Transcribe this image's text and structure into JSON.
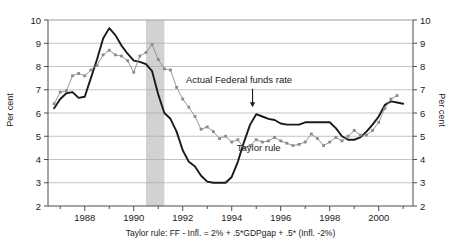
{
  "axes": {
    "ylabel_left": "Per cent",
    "ylabel_right": "Per cent",
    "yticks": [
      "2",
      "3",
      "4",
      "5",
      "6",
      "7",
      "8",
      "9",
      "10"
    ],
    "xticks": [
      "1988",
      "1990",
      "1992",
      "1994",
      "1996",
      "1998",
      "2000"
    ]
  },
  "annotations": {
    "actual_label": "Actual Federal funds rate",
    "taylor_label": "Taylor rule"
  },
  "footnote": "Taylor rule:  FF - Infl. = 2% +  .5*GDPgap +  .5* (Infl. -2%)",
  "colors": {
    "actual_line": "#1a1a1a",
    "taylor_line": "#8a8a8a",
    "recession_band": "#d2d2d2",
    "gridline": "#aaaaaa",
    "axis": "#4d4d4d"
  },
  "chart_data": {
    "type": "line",
    "title": "",
    "xlabel": "",
    "ylabel": "Per cent",
    "xlim": [
      1986.5,
      2001.4
    ],
    "ylim": [
      2,
      10
    ],
    "grid": true,
    "legend": "inline-annotations",
    "xticks": [
      1988,
      1990,
      1992,
      1994,
      1996,
      1998,
      2000
    ],
    "yticks": [
      2,
      3,
      4,
      5,
      6,
      7,
      8,
      9,
      10
    ],
    "recession_band": {
      "start": 1990.5,
      "end": 1991.25,
      "color": "#d2d2d2"
    },
    "annotations": [
      {
        "text": "Actual Federal funds rate",
        "x": 1994.3,
        "y": 7.3,
        "arrow_to_x": 1994.85,
        "arrow_to_y": 6.25
      },
      {
        "text": "Taylor rule",
        "x": 1995.1,
        "y": 4.35
      }
    ],
    "series": [
      {
        "name": "Actual Federal funds rate",
        "color": "#1a1a1a",
        "marker": "none",
        "x": [
          1986.75,
          1987.0,
          1987.25,
          1987.5,
          1987.75,
          1988.0,
          1988.25,
          1988.5,
          1988.75,
          1989.0,
          1989.25,
          1989.5,
          1989.75,
          1990.0,
          1990.25,
          1990.5,
          1990.75,
          1991.0,
          1991.25,
          1991.5,
          1991.75,
          1992.0,
          1992.25,
          1992.5,
          1992.75,
          1993.0,
          1993.25,
          1993.5,
          1993.75,
          1994.0,
          1994.25,
          1994.5,
          1994.75,
          1995.0,
          1995.25,
          1995.5,
          1995.75,
          1996.0,
          1996.25,
          1996.5,
          1996.75,
          1997.0,
          1997.25,
          1997.5,
          1997.75,
          1998.0,
          1998.25,
          1998.5,
          1998.75,
          1999.0,
          1999.25,
          1999.5,
          1999.75,
          2000.0,
          2000.25,
          2000.5,
          2000.75,
          2001.0
        ],
        "y": [
          6.2,
          6.6,
          6.85,
          6.9,
          6.65,
          6.7,
          7.5,
          8.3,
          9.2,
          9.65,
          9.35,
          8.9,
          8.55,
          8.25,
          8.2,
          8.1,
          7.8,
          6.8,
          6.0,
          5.75,
          5.2,
          4.4,
          3.9,
          3.7,
          3.3,
          3.05,
          3.0,
          3.0,
          3.0,
          3.25,
          3.9,
          4.75,
          5.5,
          5.95,
          5.85,
          5.75,
          5.7,
          5.55,
          5.5,
          5.5,
          5.5,
          5.6,
          5.6,
          5.6,
          5.6,
          5.6,
          5.35,
          5.0,
          4.85,
          4.85,
          4.95,
          5.2,
          5.5,
          5.85,
          6.35,
          6.5,
          6.45,
          6.4
        ]
      },
      {
        "name": "Taylor rule",
        "color": "#8a8a8a",
        "marker": "square",
        "x": [
          1986.75,
          1987.0,
          1987.25,
          1987.5,
          1987.75,
          1988.0,
          1988.25,
          1988.5,
          1988.75,
          1989.0,
          1989.25,
          1989.5,
          1989.75,
          1990.0,
          1990.25,
          1990.5,
          1990.75,
          1991.0,
          1991.25,
          1991.5,
          1991.75,
          1992.0,
          1992.25,
          1992.5,
          1992.75,
          1993.0,
          1993.25,
          1993.5,
          1993.75,
          1994.0,
          1994.25,
          1994.5,
          1994.75,
          1995.0,
          1995.25,
          1995.5,
          1995.75,
          1996.0,
          1996.25,
          1996.5,
          1996.75,
          1997.0,
          1997.25,
          1997.5,
          1997.75,
          1998.0,
          1998.25,
          1998.5,
          1998.75,
          1999.0,
          1999.25,
          1999.5,
          1999.75,
          2000.0,
          2000.25,
          2000.5,
          2000.75
        ],
        "y": [
          6.4,
          6.9,
          6.95,
          7.6,
          7.7,
          7.6,
          7.85,
          8.05,
          8.5,
          8.7,
          8.5,
          8.45,
          8.25,
          7.75,
          8.45,
          8.6,
          8.95,
          8.3,
          7.9,
          7.85,
          7.1,
          6.6,
          6.25,
          5.85,
          5.3,
          5.4,
          5.2,
          4.9,
          5.0,
          4.75,
          4.85,
          4.5,
          4.6,
          4.85,
          4.75,
          4.8,
          4.95,
          4.8,
          4.7,
          4.6,
          4.65,
          4.75,
          5.1,
          4.9,
          4.6,
          4.75,
          4.95,
          4.8,
          5.0,
          5.25,
          5.05,
          5.05,
          5.25,
          5.6,
          6.2,
          6.6,
          6.75
        ]
      }
    ]
  }
}
